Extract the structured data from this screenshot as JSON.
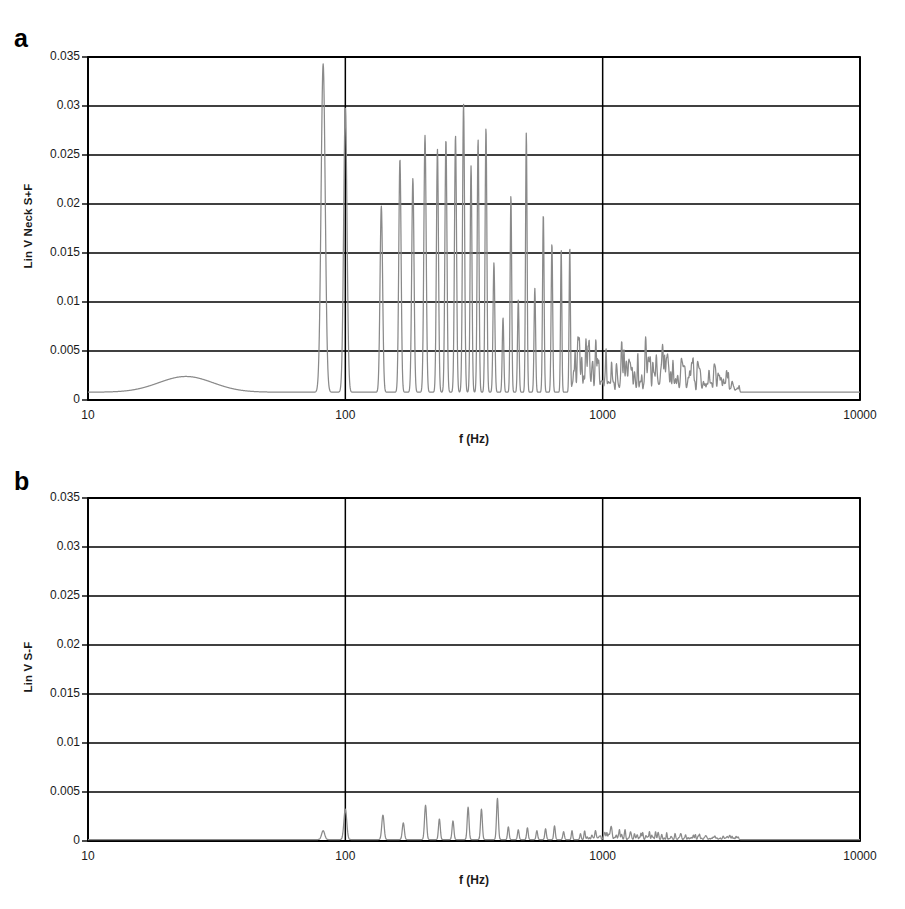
{
  "figure": {
    "panels": [
      {
        "key": "a",
        "label": "a",
        "ylabel": "Lin V Neck S+F",
        "xlabel": "f (Hz)"
      },
      {
        "key": "b",
        "label": "b",
        "ylabel": "Lin V S-F",
        "xlabel": "f (Hz)"
      }
    ]
  },
  "chart_data": [
    {
      "type": "line",
      "panel": "a",
      "title": "",
      "xlabel": "f (Hz)",
      "ylabel": "Lin V Neck S+F",
      "xscale": "log",
      "xlim": [
        10,
        10000
      ],
      "ylim": [
        0,
        0.035
      ],
      "xticks": [
        10,
        100,
        1000,
        10000
      ],
      "xticklabels": [
        "10",
        "100",
        "1000",
        "10000"
      ],
      "yticks": [
        0,
        0.005,
        0.01,
        0.015,
        0.02,
        0.025,
        0.03,
        0.035
      ],
      "yticklabels": [
        "0",
        "0.005",
        "0.01",
        "0.015",
        "0.02",
        "0.025",
        "0.03",
        "0.035"
      ],
      "grid": true,
      "grid_axis": "both",
      "legend": false,
      "line_color": "#8a8a8a",
      "baseline": 0.0008,
      "broad_bump": {
        "center_hz": 24,
        "height": 0.0016,
        "width_decades": 0.22
      },
      "peaks": [
        {
          "f": 82,
          "v": 0.0335,
          "w": 0.016
        },
        {
          "f": 100,
          "v": 0.029,
          "w": 0.013
        },
        {
          "f": 138,
          "v": 0.019,
          "w": 0.01
        },
        {
          "f": 163,
          "v": 0.0238,
          "w": 0.009
        },
        {
          "f": 183,
          "v": 0.0218,
          "w": 0.009
        },
        {
          "f": 204,
          "v": 0.0262,
          "w": 0.009
        },
        {
          "f": 228,
          "v": 0.0248,
          "w": 0.008
        },
        {
          "f": 246,
          "v": 0.0258,
          "w": 0.008
        },
        {
          "f": 268,
          "v": 0.0262,
          "w": 0.008
        },
        {
          "f": 288,
          "v": 0.0294,
          "w": 0.008
        },
        {
          "f": 308,
          "v": 0.0231,
          "w": 0.007
        },
        {
          "f": 328,
          "v": 0.0258,
          "w": 0.007
        },
        {
          "f": 352,
          "v": 0.027,
          "w": 0.007
        },
        {
          "f": 378,
          "v": 0.0132,
          "w": 0.007
        },
        {
          "f": 410,
          "v": 0.0076,
          "w": 0.006
        },
        {
          "f": 440,
          "v": 0.0201,
          "w": 0.006
        },
        {
          "f": 470,
          "v": 0.0094,
          "w": 0.006
        },
        {
          "f": 505,
          "v": 0.0265,
          "w": 0.006
        },
        {
          "f": 545,
          "v": 0.0106,
          "w": 0.006
        },
        {
          "f": 588,
          "v": 0.0182,
          "w": 0.006
        },
        {
          "f": 635,
          "v": 0.0152,
          "w": 0.006
        },
        {
          "f": 690,
          "v": 0.0146,
          "w": 0.005
        },
        {
          "f": 745,
          "v": 0.0149,
          "w": 0.005
        }
      ],
      "hash_region": {
        "f_start": 760,
        "f_end": 3400,
        "max_v": 0.0052,
        "note": "dense low-amplitude spectral grass beyond the harmonic series"
      }
    },
    {
      "type": "line",
      "panel": "b",
      "title": "",
      "xlabel": "f (Hz)",
      "ylabel": "Lin V S-F",
      "xscale": "log",
      "xlim": [
        10,
        10000
      ],
      "ylim": [
        0,
        0.035
      ],
      "xticks": [
        10,
        100,
        1000,
        10000
      ],
      "xticklabels": [
        "10",
        "100",
        "1000",
        "10000"
      ],
      "yticks": [
        0,
        0.005,
        0.01,
        0.015,
        0.02,
        0.025,
        0.03,
        0.035
      ],
      "yticklabels": [
        "0",
        "0.005",
        "0.01",
        "0.015",
        "0.02",
        "0.025",
        "0.03",
        "0.035"
      ],
      "grid": true,
      "grid_axis": "both",
      "legend": false,
      "line_color": "#8a8a8a",
      "baseline": 0.00015,
      "peaks": [
        {
          "f": 82,
          "v": 0.0009,
          "w": 0.012
        },
        {
          "f": 100,
          "v": 0.0031,
          "w": 0.011
        },
        {
          "f": 140,
          "v": 0.0025,
          "w": 0.009
        },
        {
          "f": 168,
          "v": 0.0017,
          "w": 0.008
        },
        {
          "f": 205,
          "v": 0.0035,
          "w": 0.008
        },
        {
          "f": 232,
          "v": 0.0021,
          "w": 0.007
        },
        {
          "f": 262,
          "v": 0.0019,
          "w": 0.007
        },
        {
          "f": 300,
          "v": 0.0033,
          "w": 0.007
        },
        {
          "f": 338,
          "v": 0.0031,
          "w": 0.007
        },
        {
          "f": 390,
          "v": 0.0042,
          "w": 0.007
        },
        {
          "f": 430,
          "v": 0.0013,
          "w": 0.006
        },
        {
          "f": 470,
          "v": 0.001,
          "w": 0.006
        },
        {
          "f": 510,
          "v": 0.0012,
          "w": 0.006
        },
        {
          "f": 555,
          "v": 0.0009,
          "w": 0.006
        },
        {
          "f": 600,
          "v": 0.0011,
          "w": 0.006
        },
        {
          "f": 650,
          "v": 0.0014,
          "w": 0.006
        },
        {
          "f": 705,
          "v": 0.0008,
          "w": 0.006
        },
        {
          "f": 760,
          "v": 0.0009,
          "w": 0.005
        },
        {
          "f": 820,
          "v": 0.0006,
          "w": 0.005
        }
      ],
      "hash_region": {
        "f_start": 850,
        "f_end": 3400,
        "max_v": 0.001,
        "note": "very low amplitude spectral grass"
      }
    }
  ]
}
